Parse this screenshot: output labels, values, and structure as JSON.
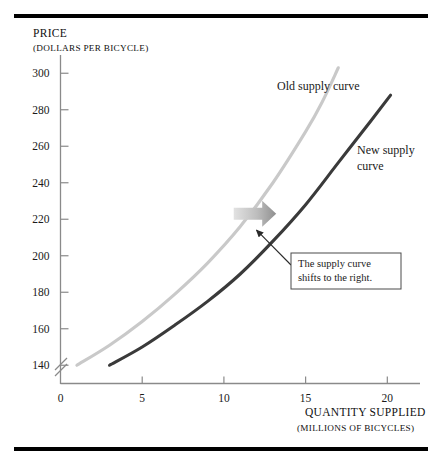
{
  "figure": {
    "rules": {
      "top": "divider-rule",
      "bottom": "divider-rule"
    }
  },
  "chart_data": {
    "type": "line",
    "title": "",
    "xlabel": "QUANTITY SUPPLIED",
    "xlabel_sub": "(MILLIONS OF BICYCLES)",
    "ylabel": "PRICE",
    "ylabel_sub": "(DOLLARS PER BICYCLE)",
    "xlim": [
      0,
      22
    ],
    "ylim": [
      130,
      310
    ],
    "y_axis_break": true,
    "grid": false,
    "legend": "inline-labels",
    "xticks": [
      0,
      5,
      10,
      15,
      20
    ],
    "xtick_labels": [
      "0",
      "5",
      "10",
      "15",
      "20"
    ],
    "yticks": [
      140,
      160,
      180,
      200,
      220,
      240,
      260,
      280,
      300
    ],
    "ytick_labels": [
      "140",
      "160",
      "180",
      "200",
      "220",
      "240",
      "260",
      "280",
      "300"
    ],
    "series": [
      {
        "name": "Old supply curve",
        "color": "#c9c9c9",
        "label": "Old supply curve",
        "x": [
          1.0,
          3.0,
          5.0,
          7.0,
          9.0,
          11.0,
          13.0,
          15.0,
          16.0,
          17.0
        ],
        "y": [
          140,
          151,
          164,
          179,
          196,
          216,
          240,
          268,
          284,
          303
        ]
      },
      {
        "name": "New supply curve",
        "color": "#3a3a3a",
        "label": "New supply\ncurve",
        "label_line1": "New supply",
        "label_line2": "curve",
        "x": [
          3.0,
          5.0,
          7.0,
          9.0,
          11.0,
          13.0,
          15.0,
          17.0,
          19.0,
          20.2
        ],
        "y": [
          140,
          150,
          162,
          175,
          190,
          208,
          228,
          251,
          274,
          288
        ]
      }
    ],
    "annotations": [
      {
        "name": "shift-arrow",
        "kind": "block-arrow",
        "direction": "right",
        "color": "#b0b0b0",
        "x_from": 10.6,
        "x_to": 13.2,
        "y": 223
      },
      {
        "name": "shift-callout",
        "kind": "boxed-text",
        "line1": "The supply curve",
        "line2": "shifts to the right.",
        "points_to_x": 12.0,
        "points_to_y": 214
      }
    ]
  }
}
